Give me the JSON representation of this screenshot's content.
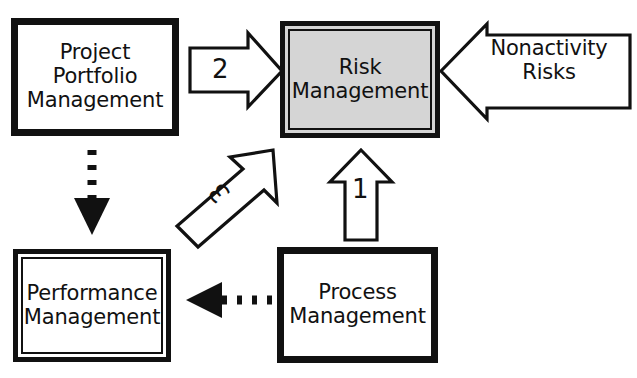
{
  "diagram": {
    "background_color": "#ffffff",
    "stroke_color": "#111111",
    "shaded_fill": "#d5d5d5",
    "nodes": [
      {
        "id": "project-portfolio-management",
        "label": "Project\nPortfolio\nManagement",
        "style": "single-thick-border",
        "fill": "#ffffff"
      },
      {
        "id": "risk-management",
        "label": "Risk\nManagement",
        "style": "double-border",
        "fill": "#d5d5d5"
      },
      {
        "id": "performance-management",
        "label": "Performance\nManagement",
        "style": "double-border",
        "fill": "#ffffff"
      },
      {
        "id": "process-management",
        "label": "Process\nManagement",
        "style": "single-thick-border",
        "fill": "#ffffff"
      }
    ],
    "callout": {
      "id": "nonactivity-risks",
      "label": "Nonactivity\nRisks",
      "shape": "left-pointing-block-arrow",
      "fill": "#ffffff",
      "target": "risk-management"
    },
    "connectors": [
      {
        "id": "arrow-2",
        "label": "2",
        "shape": "right-pointing-block-arrow",
        "from": "project-portfolio-management",
        "to": "risk-management",
        "fill": "#ffffff"
      },
      {
        "id": "arrow-1",
        "label": "1",
        "shape": "up-pointing-block-arrow",
        "from": "process-management",
        "to": "risk-management",
        "fill": "#ffffff"
      },
      {
        "id": "arrow-3",
        "label": "3",
        "shape": "diagonal-up-right-block-arrow",
        "from": "performance-management",
        "to": "risk-management",
        "fill": "#ffffff"
      },
      {
        "id": "dotted-arrow-ppm-to-perf",
        "label": "",
        "shape": "dotted-line-solid-arrowhead-down",
        "from": "project-portfolio-management",
        "to": "performance-management"
      },
      {
        "id": "dotted-arrow-proc-to-perf",
        "label": "",
        "shape": "dotted-line-solid-arrowhead-left",
        "from": "process-management",
        "to": "performance-management"
      }
    ]
  }
}
